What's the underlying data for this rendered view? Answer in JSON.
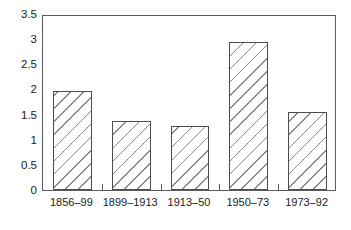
{
  "chart_data": {
    "type": "bar",
    "title": "",
    "subtitle": "",
    "xlabel": "",
    "ylabel": "",
    "categories": [
      "1856–99",
      "1899–1913",
      "1913–50",
      "1950–73",
      "1973–92"
    ],
    "values": [
      1.96,
      1.37,
      1.27,
      2.95,
      1.55
    ],
    "ylim": [
      0,
      3.5
    ],
    "yticks": [
      "0",
      "0.5",
      "1",
      "1.5",
      "2",
      "2.5",
      "3",
      "3.5"
    ],
    "ytick_values": [
      0,
      0.5,
      1,
      1.5,
      2,
      2.5,
      3,
      3.5
    ],
    "grid": false,
    "legend": null,
    "legend_position": "none",
    "bar_style": {
      "fill": "#ffffff",
      "hatch": "\\\\",
      "hatch_color": "#8a8a8a",
      "edge_color": "#4d4d4d"
    },
    "frame_color": "#5a5a5a",
    "background": "#ffffff"
  }
}
